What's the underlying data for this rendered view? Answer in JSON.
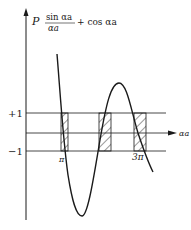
{
  "diagram": {
    "y_axis_label": {
      "prefix": "P",
      "numerator": "sin αa",
      "denominator": "αa",
      "suffix": "+ cos αa"
    },
    "x_axis_label": "αa",
    "levels": [
      {
        "label": "+1",
        "value": 1
      },
      {
        "label": "",
        "value": 0
      },
      {
        "label": "−1",
        "value": -1
      }
    ],
    "x_ticks": [
      {
        "label": "π"
      },
      {
        "label": "3π"
      }
    ],
    "curve_description": "Oscillating function P·sin(αa)/(αa) + cos(αa); allowed bands (hatched) where value lies between −1 and +1",
    "allowed_bands_count": 3,
    "colors": {
      "ink": "#1a1a1a",
      "background": "#ffffff"
    }
  }
}
